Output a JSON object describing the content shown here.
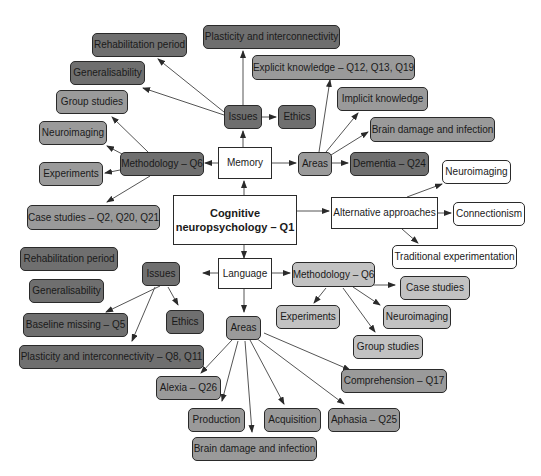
{
  "diagram": {
    "title": "Cognitive neuropsychology – Q1",
    "colors": {
      "dark": "#6f6f6f",
      "mid": "#9a9a9a",
      "light": "#c2c2c2",
      "white": "#ffffff",
      "stroke": "#2a2a2a"
    },
    "nodes": {
      "center": "Cognitive neuropsychology – Q1",
      "memory": "Memory",
      "language": "Language",
      "alt": "Alternative approaches",
      "mem_issues": "Issues",
      "mem_rehab": "Rehabilitation period",
      "mem_general": "Generalisability",
      "mem_plastic": "Plasticity and interconnectivity",
      "mem_ethics": "Ethics",
      "mem_method": "Methodology – Q6",
      "mem_group": "Group studies",
      "mem_neuro": "Neuroimaging",
      "mem_exp": "Experiments",
      "mem_case": "Case studies – Q2, Q20, Q21",
      "mem_areas": "Areas",
      "mem_explicit": "Explicit knowledge – Q12, Q13, Q19",
      "mem_implicit": "Implicit knowledge",
      "mem_brain": "Brain damage and infection",
      "mem_dementia": "Dementia – Q24",
      "alt_neuro": "Neuroimaging",
      "alt_conn": "Connectionism",
      "alt_trad": "Traditional experimentation",
      "lang_issues": "Issues",
      "lang_rehab": "Rehabilitation period",
      "lang_general": "Generalisability",
      "lang_baseline": "Baseline missing – Q5",
      "lang_ethics": "Ethics",
      "lang_plastic": "Plasticity and interconnectivity – Q8, Q11",
      "lang_method": "Methodology – Q6",
      "lang_case": "Case studies",
      "lang_exp": "Experiments",
      "lang_neuro": "Neuroimaging",
      "lang_group": "Group studies",
      "lang_areas": "Areas",
      "lang_alexia": "Alexia – Q26",
      "lang_prod": "Production",
      "lang_brain": "Brain damage and infection",
      "lang_acq": "Acquisition",
      "lang_aphasia": "Aphasia – Q25",
      "lang_comp": "Comprehension – Q17"
    }
  }
}
